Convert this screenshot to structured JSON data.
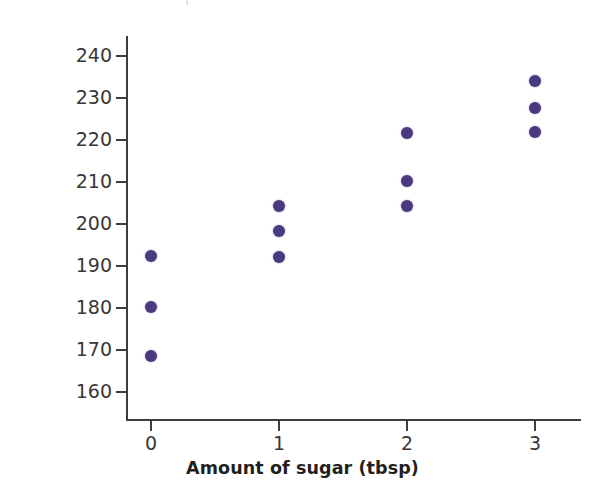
{
  "chart_data": {
    "type": "scatter",
    "title": "",
    "xlabel": "Amount of sugar (tbsp)",
    "ylabel": "Freshness (h)",
    "xlim": [
      -0.35,
      3.45
    ],
    "ylim": [
      155,
      244
    ],
    "grid": false,
    "legend": "none",
    "point_color": "#4a3a80",
    "axis_color": "#3f3c3d",
    "x_ticks": [
      0,
      1,
      2,
      3
    ],
    "x_tick_labels": [
      "0",
      "1",
      "2",
      "3"
    ],
    "y_ticks": [
      160,
      170,
      180,
      190,
      200,
      210,
      220,
      230,
      240
    ],
    "y_tick_labels": [
      "160",
      "170",
      "180",
      "190",
      "200",
      "210",
      "220",
      "230",
      "240"
    ],
    "points": [
      {
        "x": 0,
        "y": 192.3
      },
      {
        "x": 0,
        "y": 180.3
      },
      {
        "x": 0,
        "y": 168.6
      },
      {
        "x": 1,
        "y": 204.2
      },
      {
        "x": 1,
        "y": 198.4
      },
      {
        "x": 1,
        "y": 192.2
      },
      {
        "x": 2,
        "y": 221.7
      },
      {
        "x": 2,
        "y": 210.3
      },
      {
        "x": 2,
        "y": 204.4
      },
      {
        "x": 3,
        "y": 234.0
      },
      {
        "x": 3,
        "y": 227.6
      },
      {
        "x": 3,
        "y": 221.8
      }
    ],
    "series": [
      {
        "name": "Freshness vs sugar",
        "x": [
          0,
          0,
          0,
          1,
          1,
          1,
          2,
          2,
          2,
          3,
          3,
          3
        ],
        "values": [
          192.3,
          180.3,
          168.6,
          204.2,
          198.4,
          192.2,
          221.7,
          210.3,
          204.4,
          234.0,
          227.6,
          221.8
        ]
      }
    ]
  }
}
